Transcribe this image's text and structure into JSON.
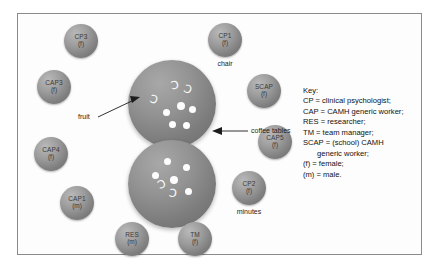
{
  "diagram": {
    "people": [
      {
        "code": "CP3",
        "sex": "(f)",
        "caption": ""
      },
      {
        "code": "CP1",
        "sex": "(f)",
        "caption": "chair"
      },
      {
        "code": "CAP3",
        "sex": "(f)",
        "caption": ""
      },
      {
        "code": "SCAP",
        "sex": "(f)",
        "caption": ""
      },
      {
        "code": "CAP4",
        "sex": "(f)",
        "caption": ""
      },
      {
        "code": "CAP5",
        "sex": "(f)",
        "caption": ""
      },
      {
        "code": "CAP1",
        "sex": "(m)",
        "caption": ""
      },
      {
        "code": "CP2",
        "sex": "(f)",
        "caption": "minutes"
      },
      {
        "code": "RES",
        "sex": "(m)",
        "caption": ""
      },
      {
        "code": "TM",
        "sex": "(f)",
        "caption": ""
      }
    ],
    "annotations": {
      "fruit": "fruit",
      "coffee_tables": "coffee tables"
    },
    "captions": {
      "chair": "chair",
      "minutes": "minutes"
    },
    "crescent_glyph": "Ɔ"
  },
  "key": {
    "title": "Key:",
    "lines": [
      "CP = clinical psychologist;",
      "CAP = CAMH generic worker;",
      "RES = researcher;",
      "TM = team manager;",
      "SCAP = (school) CAMH",
      "generic worker;",
      "(f) = female;",
      "(m) = male."
    ]
  },
  "colors": {
    "frame_border": "#8b8b8b",
    "sphere_mid": "#949494",
    "item_white": "#fdfdfd",
    "text": "#111111"
  }
}
